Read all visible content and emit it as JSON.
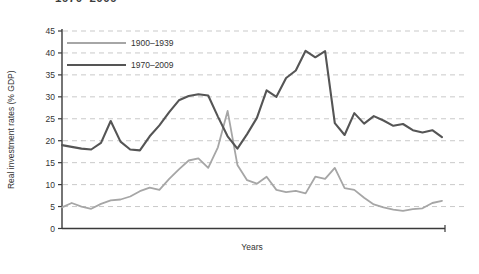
{
  "page": {
    "cropped_title_fragment": "1970–2009"
  },
  "chart_data": {
    "type": "line",
    "title": "",
    "xlabel": "Years",
    "ylabel": "Real investment rates (% GDP)",
    "ylim": [
      0,
      45
    ],
    "yticks": [
      0,
      5,
      10,
      15,
      20,
      25,
      30,
      35,
      40,
      45
    ],
    "x_axis_ticks_shown": false,
    "grid": "horizontal-dashed",
    "legend_position": "top-left-inside",
    "x_point_count": 40,
    "series": [
      {
        "name": "1900–1939",
        "color": "#a6a6a6",
        "values": [
          4.8,
          5.8,
          5.0,
          4.5,
          5.6,
          6.4,
          6.6,
          7.3,
          8.5,
          9.3,
          8.8,
          11.3,
          13.5,
          15.5,
          16.0,
          13.8,
          18.5,
          26.8,
          14.5,
          11.0,
          10.2,
          11.8,
          8.8,
          8.3,
          8.6,
          8.0,
          11.8,
          11.3,
          13.8,
          9.2,
          8.8,
          7.0,
          5.5,
          4.8,
          4.3,
          4.0,
          4.4,
          4.6,
          5.8,
          6.3
        ]
      },
      {
        "name": "1970–2009",
        "color": "#555555",
        "values": [
          19.0,
          18.6,
          18.2,
          18.0,
          19.5,
          24.5,
          19.8,
          18.0,
          17.8,
          21.0,
          23.5,
          26.5,
          29.2,
          30.2,
          30.6,
          30.3,
          25.5,
          21.0,
          18.2,
          21.5,
          25.2,
          31.5,
          30.0,
          34.3,
          36.0,
          40.5,
          39.0,
          40.4,
          24.0,
          21.3,
          26.3,
          23.9,
          25.6,
          24.6,
          23.4,
          23.8,
          22.4,
          21.9,
          22.4,
          20.8
        ]
      }
    ],
    "colors": {
      "axis": "#3a3a3a",
      "grid": "#c9c9c9",
      "text": "#333333"
    }
  }
}
